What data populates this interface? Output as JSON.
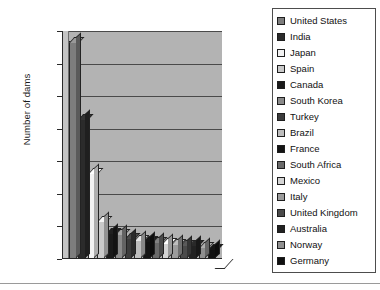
{
  "chart_data": {
    "type": "bar",
    "title": "",
    "xlabel": "",
    "ylabel": "Number of dams",
    "ylim": [
      0,
      7000
    ],
    "ytick_step": 1000,
    "yticks": [
      "7000",
      "6000",
      "5000",
      "4000",
      "3000",
      "2000",
      "1000",
      "0"
    ],
    "grid": true,
    "legend_position": "right",
    "categories": [
      "United States",
      "India",
      "Japan",
      "Spain",
      "Canada",
      "South Korea",
      "Turkey",
      "Brazil",
      "France",
      "South Africa",
      "Mexico",
      "Italy",
      "United Kingdom",
      "Australia",
      "Norway",
      "Germany"
    ],
    "values": [
      6690,
      4330,
      2670,
      1200,
      840,
      790,
      670,
      610,
      580,
      540,
      520,
      490,
      470,
      450,
      400,
      350
    ],
    "series": [
      {
        "name": "Number of dams",
        "values": [
          6690,
          4330,
          2670,
          1200,
          840,
          790,
          670,
          610,
          580,
          540,
          520,
          490,
          470,
          450,
          400,
          350
        ]
      }
    ],
    "colors": [
      "#7d7d7d",
      "#2b2b2b",
      "#f2f2f2",
      "#c9c9c9",
      "#1a1a1a",
      "#8a8a8a",
      "#3c3c3c",
      "#bdbdbd",
      "#141414",
      "#6a6a6a",
      "#d4d4d4",
      "#9c9c9c",
      "#4a4a4a",
      "#222222",
      "#8f8f8f",
      "#101010"
    ],
    "plot_background": "#b3b3b3"
  },
  "legend": {
    "items": [
      {
        "label": "United States",
        "color": "#7d7d7d"
      },
      {
        "label": "India",
        "color": "#2b2b2b"
      },
      {
        "label": "Japan",
        "color": "#f2f2f2"
      },
      {
        "label": "Spain",
        "color": "#c9c9c9"
      },
      {
        "label": "Canada",
        "color": "#1a1a1a"
      },
      {
        "label": "South Korea",
        "color": "#8a8a8a"
      },
      {
        "label": "Turkey",
        "color": "#3c3c3c"
      },
      {
        "label": "Brazil",
        "color": "#bdbdbd"
      },
      {
        "label": "France",
        "color": "#141414"
      },
      {
        "label": "South Africa",
        "color": "#6a6a6a"
      },
      {
        "label": "Mexico",
        "color": "#d4d4d4"
      },
      {
        "label": "Italy",
        "color": "#9c9c9c"
      },
      {
        "label": "United Kingdom",
        "color": "#4a4a4a"
      },
      {
        "label": "Australia",
        "color": "#222222"
      },
      {
        "label": "Norway",
        "color": "#8f8f8f"
      },
      {
        "label": "Germany",
        "color": "#101010"
      }
    ]
  }
}
